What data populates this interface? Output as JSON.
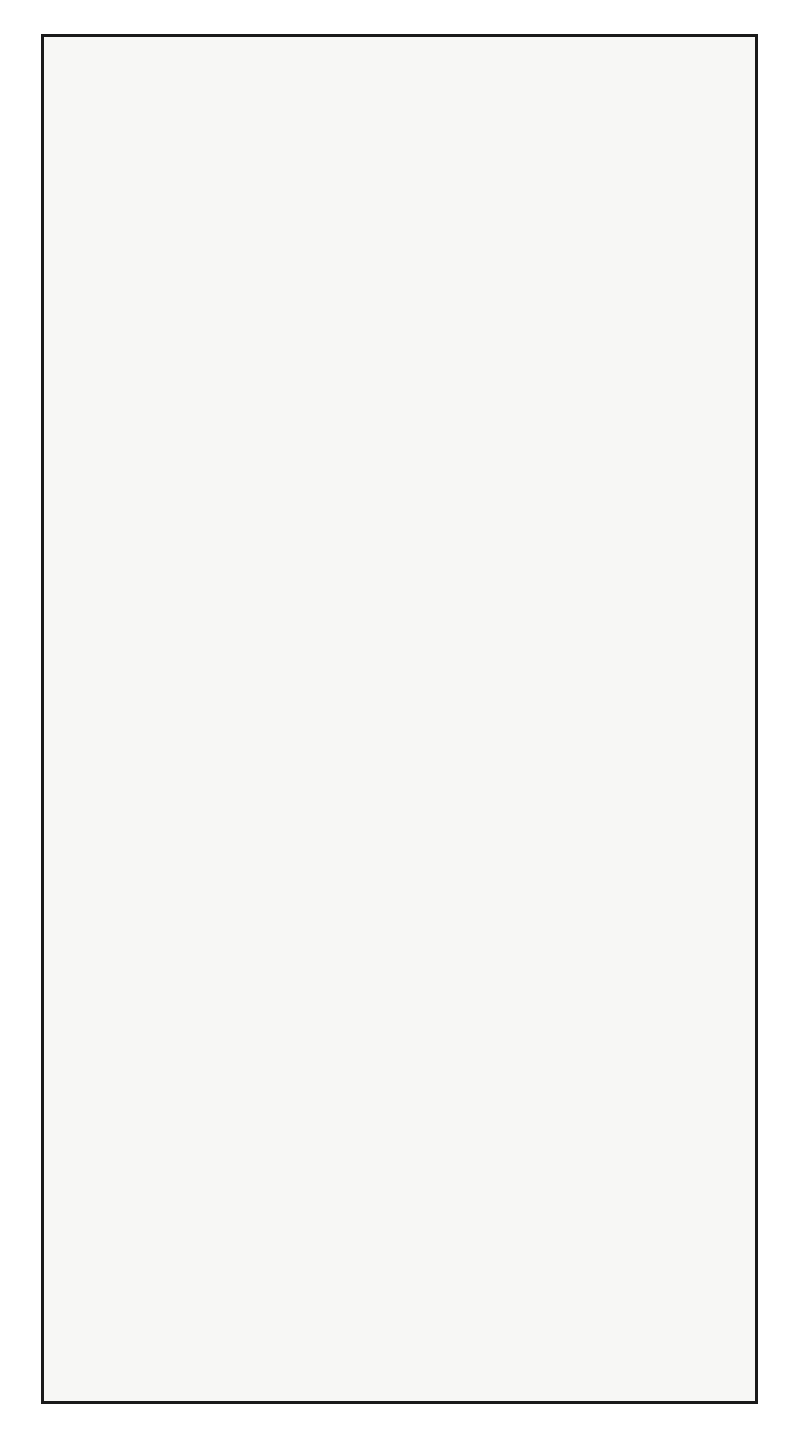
{
  "figure": {
    "kind": "world-map",
    "projection": "interrupted sinusoidal / Goode homolosine (3 lobes)",
    "orientation_deg": 90,
    "background_color": "#f7f7f5",
    "land_color": "#111111",
    "graticule_color": "#3a3a3a",
    "frame_color": "#1a1a1a",
    "graticule_step_deg": 10,
    "dashed_parallels": [
      "tropic of cancer 23.5 N",
      "tropic of capricorn 23.5 S"
    ]
  },
  "chart_data": {
    "type": "map",
    "title": "",
    "xlabel": "",
    "ylabel": "",
    "latitude_range": [
      -90,
      90
    ],
    "longitude_range": [
      -180,
      180
    ],
    "grid": true,
    "legend": "none",
    "lobes": [
      {
        "name": "atlantic-lobe",
        "central_meridian": -20,
        "lon_from": -100,
        "lon_to": 20
      },
      {
        "name": "pacific-lobe",
        "central_meridian": -160,
        "lon_to": -100,
        "lon_from": 160
      },
      {
        "name": "indian-lobe",
        "central_meridian": 80,
        "lon_from": 20,
        "lon_to": 160
      }
    ],
    "latitude_labels": [
      80,
      70,
      60,
      50,
      40,
      30,
      20,
      10,
      0,
      10,
      20,
      30,
      40,
      50,
      60,
      70,
      80
    ],
    "longitude_labels_atlantic": [
      100,
      90,
      80,
      70,
      60,
      50,
      40,
      30,
      20,
      10,
      0,
      10,
      20,
      30,
      40,
      50,
      60,
      70,
      80
    ],
    "longitude_labels_pacific": [
      120,
      140,
      160,
      180,
      160,
      140,
      120,
      100
    ],
    "longitude_labels_indian": [
      20,
      30,
      40,
      50,
      60,
      70,
      80,
      90,
      100,
      120,
      140,
      160
    ]
  },
  "labels": {
    "lat_north": [
      "80",
      "70",
      "60",
      "50",
      "40",
      "30",
      "20",
      "10",
      "0"
    ],
    "lat_south": [
      "10",
      "20",
      "30",
      "40",
      "50",
      "60",
      "70",
      "80"
    ],
    "lon_values": [
      "0",
      "10",
      "20",
      "30",
      "40",
      "50",
      "60",
      "70",
      "80",
      "90",
      "100",
      "120",
      "140",
      "160",
      "180"
    ]
  }
}
